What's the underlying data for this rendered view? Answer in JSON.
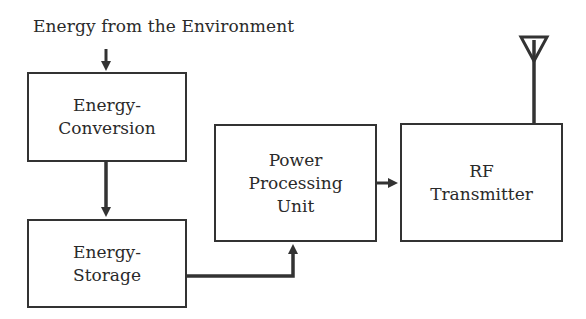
{
  "diagram": {
    "type": "block-diagram",
    "input_label": "Energy from the Environment",
    "blocks": [
      {
        "id": "energy-conversion",
        "lines": [
          "Energy-",
          "Conversion"
        ]
      },
      {
        "id": "energy-storage",
        "lines": [
          "Energy-",
          "Storage"
        ]
      },
      {
        "id": "power-processing-unit",
        "lines": [
          "Power",
          "Processing",
          "Unit"
        ]
      },
      {
        "id": "rf-transmitter",
        "lines": [
          "RF",
          "Transmitter"
        ]
      }
    ],
    "edges": [
      {
        "from": "input",
        "to": "energy-conversion"
      },
      {
        "from": "energy-conversion",
        "to": "energy-storage"
      },
      {
        "from": "energy-storage",
        "to": "power-processing-unit"
      },
      {
        "from": "power-processing-unit",
        "to": "rf-transmitter"
      },
      {
        "from": "rf-transmitter",
        "to": "antenna"
      }
    ],
    "colors": {
      "stroke": "#333333",
      "text": "#2a2a2a",
      "background": "#ffffff"
    }
  }
}
